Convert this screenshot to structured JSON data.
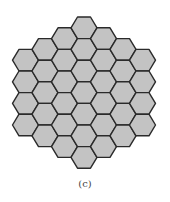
{
  "figure": {
    "type": "hexagonal-grid",
    "orientation": "flat-topped",
    "columns": [
      4,
      5,
      6,
      7,
      6,
      5,
      4
    ],
    "total_cells": 37,
    "center_x": 84,
    "top_y": 17,
    "hex_width": 26,
    "hex_height": 21.6,
    "fill_color": "#c3c3c3",
    "stroke_color": "#2a2a2a",
    "stroke_width": 1.4
  },
  "caption": "(c)"
}
